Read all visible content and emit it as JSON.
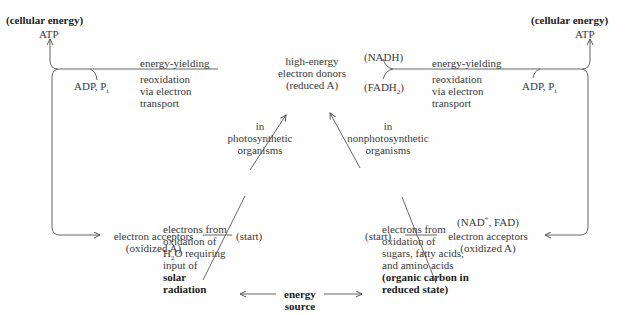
{
  "left": {
    "label": "(cellular energy)",
    "atp": "ATP",
    "adp": "ADP, P",
    "adp_sub": "i",
    "process": [
      "energy-yielding",
      "reoxidation",
      "via electron",
      "transport"
    ],
    "acceptors": [
      "electron acceptors",
      "(oxidized A)"
    ],
    "start": "(start)",
    "organisms": [
      "in",
      "photosynthetic",
      "organisms"
    ],
    "source": [
      "electrons from",
      "oxidation of",
      "O requiring",
      "input of"
    ],
    "source_h2o_prefix": "H",
    "source_h2o_sub": "2",
    "source_bold": [
      "solar",
      "radiation"
    ]
  },
  "center": {
    "donors": [
      "high-energy",
      "electron donors",
      "(reduced A)"
    ],
    "energy_source": [
      "energy",
      "source"
    ]
  },
  "right": {
    "label": "(cellular energy)",
    "atp": "ATP",
    "adp": "ADP, P",
    "adp_sub": "i",
    "nadh": "(NADH)",
    "fadh_prefix": "(FADH",
    "fadh_sub": "2",
    "fadh_suffix": ")",
    "process": [
      "energy-yielding",
      "reoxidation",
      "via electron",
      "transport"
    ],
    "acceptors_cof_prefix": "(NAD",
    "acceptors_cof_sup": "+",
    "acceptors_cof_suffix": ", FAD)",
    "acceptors": [
      "electron acceptors",
      "(oxidized A)"
    ],
    "start": "(start)",
    "organisms": [
      "in",
      "nonphotosynthetic",
      "organisms"
    ],
    "source": [
      "electrons from",
      "oxidation of",
      "sugars, fatty acids,",
      "and amino acids"
    ],
    "source_bold": [
      "(organic carbon in",
      "reduced state)"
    ]
  }
}
